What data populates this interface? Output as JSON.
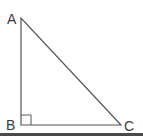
{
  "diagram": {
    "type": "right-triangle",
    "vertices": [
      {
        "name": "A",
        "label": "A",
        "x": 21,
        "y": 18
      },
      {
        "name": "B",
        "label": "B",
        "x": 21,
        "y": 125
      },
      {
        "name": "C",
        "label": "C",
        "x": 121,
        "y": 125
      }
    ],
    "right_angle_at": "B",
    "right_angle_marker_size": 10,
    "colors": {
      "line": "#555555",
      "label": "#3a3a3a",
      "bottom_bar": "#4a4a4a",
      "background": "#ffffff"
    }
  }
}
